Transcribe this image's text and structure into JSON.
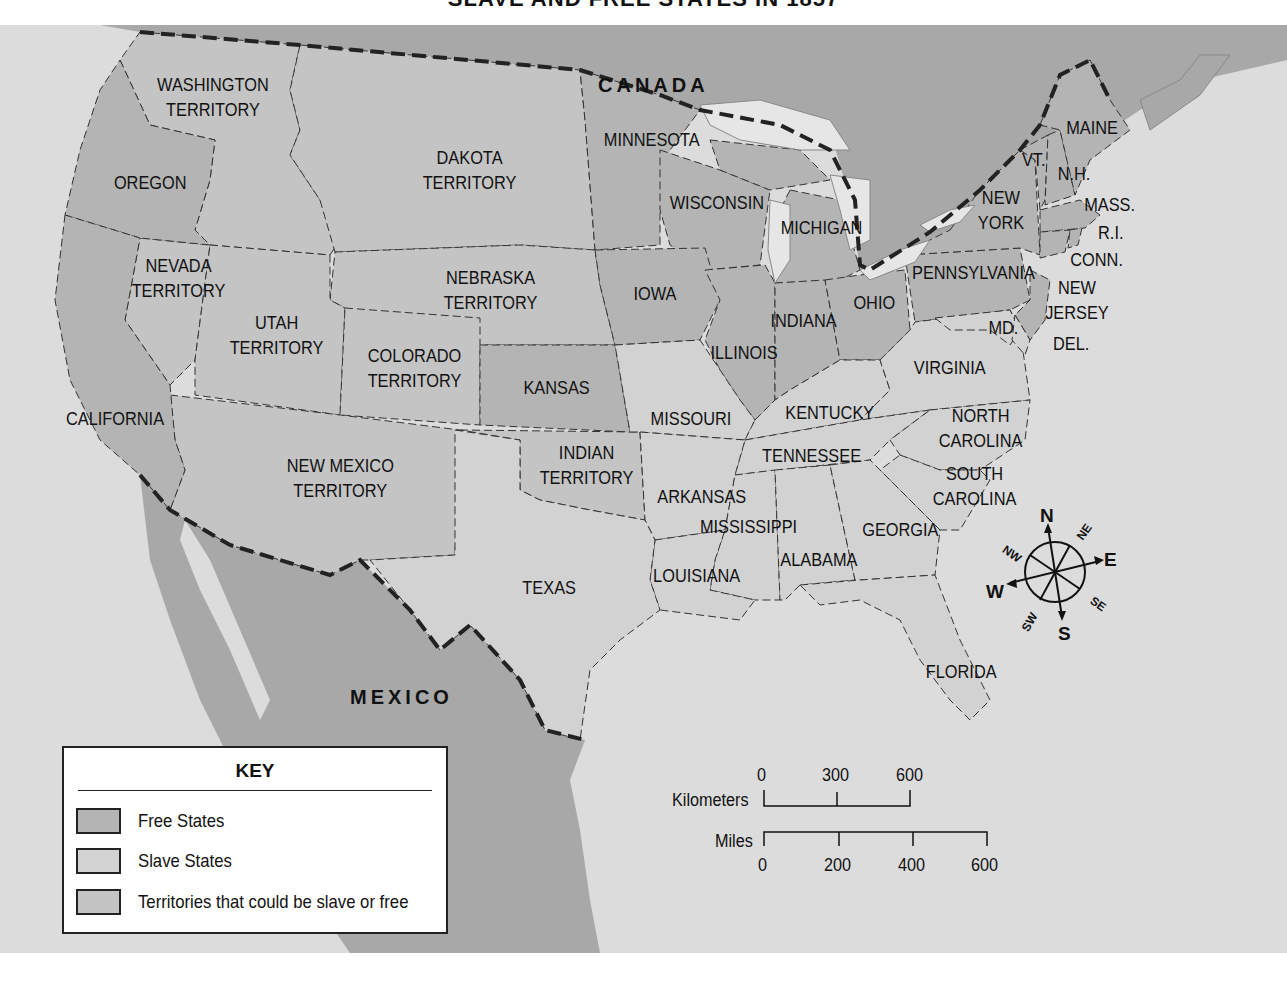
{
  "title": "SLAVE AND FREE STATES IN 1857",
  "colors": {
    "ocean": "#dcdcdc",
    "foreign_land": "#a8a8a8",
    "free_states": "#b4b4b4",
    "slave_states": "#d2d2d2",
    "territories": "#c4c4c4",
    "lakes": "#e6e6e6",
    "border": "#222222"
  },
  "countries": {
    "canada": "CANADA",
    "mexico": "MEXICO"
  },
  "regions": {
    "washington": {
      "line1": "WASHINGTON",
      "line2": "TERRITORY",
      "status": "territory"
    },
    "oregon": {
      "line1": "OREGON",
      "status": "free"
    },
    "dakota": {
      "line1": "DAKOTA",
      "line2": "TERRITORY",
      "status": "territory"
    },
    "minnesota": {
      "line1": "MINNESOTA",
      "status": "free"
    },
    "wisconsin": {
      "line1": "WISCONSIN",
      "status": "free"
    },
    "michigan": {
      "line1": "MICHIGAN",
      "status": "free"
    },
    "maine": {
      "line1": "MAINE",
      "status": "free"
    },
    "vermont": {
      "line1": "VT.",
      "status": "free"
    },
    "new_hampshire": {
      "line1": "N.H.",
      "status": "free"
    },
    "massachusetts": {
      "line1": "MASS.",
      "status": "free"
    },
    "rhode_island": {
      "line1": "R.I.",
      "status": "free"
    },
    "connecticut": {
      "line1": "CONN.",
      "status": "free"
    },
    "new_york": {
      "line1": "NEW",
      "line2": "YORK",
      "status": "free"
    },
    "pennsylvania": {
      "line1": "PENNSYLVANIA",
      "status": "free"
    },
    "new_jersey": {
      "line1": "NEW",
      "line2": "JERSEY",
      "status": "free"
    },
    "maryland": {
      "line1": "MD.",
      "status": "slave"
    },
    "delaware": {
      "line1": "DEL.",
      "status": "slave"
    },
    "nevada": {
      "line1": "NEVADA",
      "line2": "TERRITORY",
      "status": "territory"
    },
    "nebraska": {
      "line1": "NEBRASKA",
      "line2": "TERRITORY",
      "status": "territory"
    },
    "iowa": {
      "line1": "IOWA",
      "status": "free"
    },
    "utah": {
      "line1": "UTAH",
      "line2": "TERRITORY",
      "status": "territory"
    },
    "colorado": {
      "line1": "COLORADO",
      "line2": "TERRITORY",
      "status": "territory"
    },
    "kansas": {
      "line1": "KANSAS",
      "status": "free"
    },
    "illinois": {
      "line1": "ILLINOIS",
      "status": "free"
    },
    "indiana": {
      "line1": "INDIANA",
      "status": "free"
    },
    "ohio": {
      "line1": "OHIO",
      "status": "free"
    },
    "virginia": {
      "line1": "VIRGINIA",
      "status": "slave"
    },
    "california": {
      "line1": "CALIFORNIA",
      "status": "free"
    },
    "missouri": {
      "line1": "MISSOURI",
      "status": "slave"
    },
    "kentucky": {
      "line1": "KENTUCKY",
      "status": "slave"
    },
    "north_carolina": {
      "line1": "NORTH",
      "line2": "CAROLINA",
      "status": "slave"
    },
    "new_mexico": {
      "line1": "NEW MEXICO",
      "line2": "TERRITORY",
      "status": "territory"
    },
    "indian": {
      "line1": "INDIAN",
      "line2": "TERRITORY",
      "status": "territory"
    },
    "tennessee": {
      "line1": "TENNESSEE",
      "status": "slave"
    },
    "south_carolina": {
      "line1": "SOUTH",
      "line2": "CAROLINA",
      "status": "slave"
    },
    "arkansas": {
      "line1": "ARKANSAS",
      "status": "slave"
    },
    "mississippi": {
      "line1": "MISSISSIPPI",
      "status": "slave"
    },
    "georgia": {
      "line1": "GEORGIA",
      "status": "slave"
    },
    "alabama": {
      "line1": "ALABAMA",
      "status": "slave"
    },
    "louisiana": {
      "line1": "LOUISIANA",
      "status": "slave"
    },
    "texas": {
      "line1": "TEXAS",
      "status": "slave"
    },
    "florida": {
      "line1": "FLORIDA",
      "status": "slave"
    }
  },
  "key": {
    "title": "KEY",
    "items": [
      {
        "label": "Free States",
        "color": "#b4b4b4"
      },
      {
        "label": "Slave States",
        "color": "#d2d2d2"
      },
      {
        "label": "Territories that could be slave or free",
        "color": "#c4c4c4"
      }
    ]
  },
  "scale": {
    "km_label": "Kilometers",
    "km_ticks": [
      "0",
      "300",
      "600"
    ],
    "mi_label": "Miles",
    "mi_ticks": [
      "0",
      "200",
      "400",
      "600"
    ]
  },
  "compass": {
    "n": "N",
    "ne": "NE",
    "e": "E",
    "se": "SE",
    "s": "S",
    "sw": "SW",
    "w": "W",
    "nw": "NW"
  }
}
